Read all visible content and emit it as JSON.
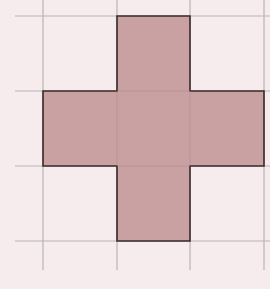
{
  "figure": {
    "grid": {
      "vertical_lines_x": [
        43,
        117,
        190,
        264
      ],
      "horizontal_lines_y": [
        16,
        91,
        166,
        241
      ],
      "line_color": "#b9b3b3"
    },
    "shape": {
      "type": "cross",
      "unit_squares": 5,
      "fill_color": "#c49a9c",
      "stroke_color": "#3a2a2b",
      "points": "117,16 190,16 190,91 264,91 264,166 190,166 190,241 117,241 117,166 43,166 43,91 117,91"
    },
    "background_color": "#f6eced"
  }
}
